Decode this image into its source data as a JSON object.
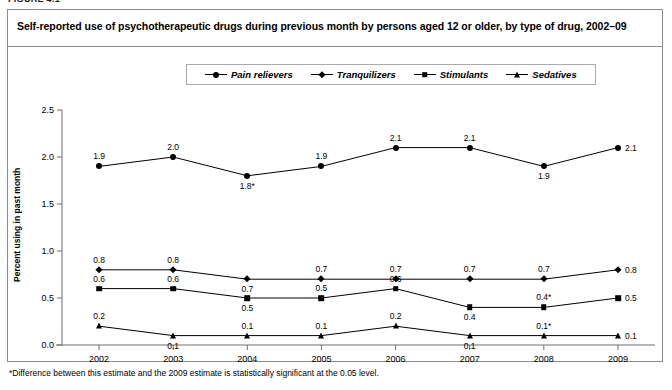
{
  "figure": {
    "number_label": "FIGURE 4.1",
    "title": "Self-reported use of psychotherapeutic drugs during previous month by persons aged 12 or older, by type of drug, 2002–09",
    "footnote": "*Difference between this estimate and the 2009 estimate is statistically significant at the 0.05 level."
  },
  "chart_data": {
    "type": "line",
    "title": "Self-reported use of psychotherapeutic drugs during previous month by persons aged 12 or older, by type of drug, 2002–09",
    "xlabel": "",
    "ylabel": "Percent using in past month",
    "x": [
      "2002",
      "2003",
      "2004",
      "2005",
      "2006",
      "2007",
      "2008",
      "2009"
    ],
    "categories": [
      "2002",
      "2003",
      "2004",
      "2005",
      "2006",
      "2007",
      "2008",
      "2009"
    ],
    "ylim": [
      0.0,
      2.5
    ],
    "yticks": [
      "0.0",
      "0.5",
      "1.0",
      "1.5",
      "2.0",
      "2.5"
    ],
    "ytick_values": [
      0.0,
      0.5,
      1.0,
      1.5,
      2.0,
      2.5
    ],
    "grid": false,
    "legend_position": "top-center",
    "series": [
      {
        "name": "Pain relievers",
        "marker": "circle",
        "values": [
          1.9,
          2.0,
          1.8,
          1.9,
          2.1,
          2.1,
          1.9,
          2.1
        ],
        "labels": [
          "1.9",
          "2.0",
          "1.8*",
          "1.9",
          "2.1",
          "2.1",
          "1.9",
          "2.1"
        ],
        "significant": [
          false,
          false,
          true,
          false,
          false,
          false,
          false,
          false
        ]
      },
      {
        "name": "Tranquilizers",
        "marker": "diamond",
        "values": [
          0.8,
          0.8,
          0.7,
          0.7,
          0.7,
          0.7,
          0.7,
          0.8
        ],
        "labels": [
          "0.8",
          "0.8",
          "0.7",
          "0.7",
          "0.7",
          "0.7",
          "0.7",
          "0.8"
        ],
        "significant": [
          false,
          false,
          false,
          false,
          false,
          false,
          false,
          false
        ]
      },
      {
        "name": "Stimulants",
        "marker": "square",
        "values": [
          0.6,
          0.6,
          0.5,
          0.5,
          0.6,
          0.4,
          0.4,
          0.5
        ],
        "labels": [
          "0.6",
          "0.6",
          "0.5",
          "0.5",
          "0.6",
          "0.4",
          "0.4*",
          "0.5"
        ],
        "significant": [
          false,
          false,
          false,
          false,
          false,
          false,
          true,
          false
        ]
      },
      {
        "name": "Sedatives",
        "marker": "triangle",
        "values": [
          0.2,
          0.1,
          0.1,
          0.1,
          0.2,
          0.1,
          0.1,
          0.1
        ],
        "labels": [
          "0.2",
          "0.1",
          "0.1",
          "0.1",
          "0.2",
          "0.1",
          "0.1*",
          "0.1"
        ],
        "significant": [
          false,
          false,
          false,
          false,
          false,
          false,
          true,
          false
        ]
      }
    ],
    "annotations": [
      "*Difference between this estimate and the 2009 estimate is statistically significant at the 0.05 level."
    ],
    "colors": {
      "line": "#000000",
      "marker": "#000000",
      "axis": "#6f6f6f",
      "frame": "#8d8d8d"
    }
  }
}
